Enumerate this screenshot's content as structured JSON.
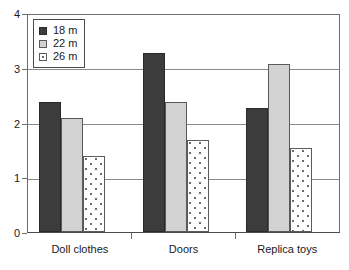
{
  "chart_data": {
    "type": "bar",
    "title": "",
    "subtitle": "",
    "xlabel": "",
    "ylabel": "",
    "categories": [
      "Doll clothes",
      "Doors",
      "Replica toys"
    ],
    "series": [
      {
        "name": "18 m",
        "values": [
          2.4,
          3.3,
          2.28
        ],
        "color": "#3c3c3c",
        "pattern": "solid-dark"
      },
      {
        "name": "22 m",
        "values": [
          2.1,
          2.4,
          3.1
        ],
        "color": "#d2d2d2",
        "pattern": "solid-light-gray"
      },
      {
        "name": "26 m",
        "values": [
          1.4,
          1.7,
          1.55
        ],
        "color": "#ffffff",
        "pattern": "dotted"
      }
    ],
    "ylim": [
      0,
      4
    ],
    "yticks": [
      0,
      1,
      2,
      3,
      4
    ],
    "ytick_labels": [
      "0",
      "1",
      "2",
      "3",
      "4"
    ],
    "grid": true,
    "grid_axis": "y",
    "legend_position": "top-left",
    "legend_entries": [
      "18 m",
      "22 m",
      "26 m"
    ]
  },
  "axes": {
    "y_tick_labels": [
      "4",
      "3",
      "2",
      "1",
      "0"
    ]
  },
  "legend": {
    "items": [
      {
        "label": "18 m"
      },
      {
        "label": "22 m"
      },
      {
        "label": "26 m"
      }
    ]
  }
}
